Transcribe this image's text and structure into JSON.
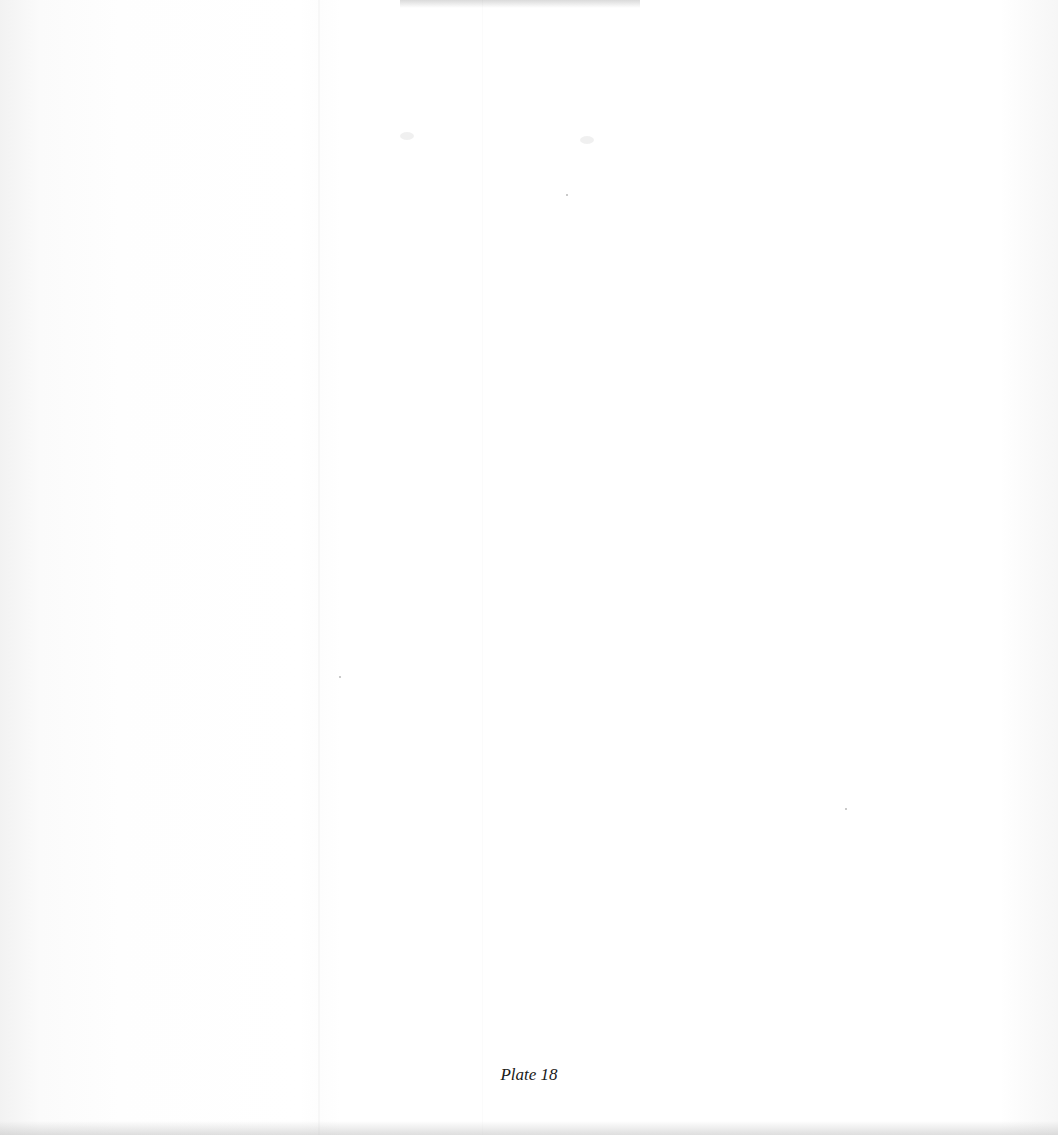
{
  "page": {
    "caption": "Plate 18"
  }
}
